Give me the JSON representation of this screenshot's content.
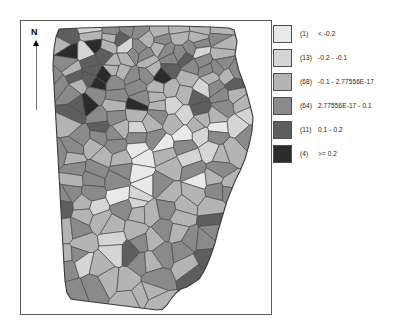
{
  "map": {
    "title": "Georgia Counties Choropleth",
    "north_arrow": {
      "label": "N",
      "icon": "north-arrow-icon"
    },
    "region": "Georgia",
    "feature_count": 161,
    "polygon_outline_color": "#4a4a4a",
    "background_color": "#ffffff",
    "frame_color": "#5a5a5a"
  },
  "legend": {
    "classes": [
      {
        "count": "(1)",
        "range": "<    -0.2",
        "color": "#e9e9e9"
      },
      {
        "count": "(13)",
        "range": "-0.2 -     -0.1",
        "color": "#d5d5d5"
      },
      {
        "count": "(68)",
        "range": "-0.1 - 2.77556E-17",
        "color": "#b4b4b4"
      },
      {
        "count": "(64)",
        "range": "2.77556E-17 -      0.1",
        "color": "#8a8a8a"
      },
      {
        "count": "(11)",
        "range": "0.1 -      0.2",
        "color": "#5e5e5e"
      },
      {
        "count": "(4)",
        "range": ">=    0.2",
        "color": "#2b2b2b"
      }
    ]
  },
  "chart_data": {
    "type": "heatmap",
    "categories": [
      "< -0.2",
      "-0.2 - -0.1",
      "-0.1 - 2.77556E-17",
      "2.77556E-17 - 0.1",
      "0.1 - 0.2",
      ">= 0.2"
    ],
    "values": [
      1,
      13,
      68,
      64,
      11,
      4
    ],
    "colors": [
      "#e9e9e9",
      "#d5d5d5",
      "#b4b4b4",
      "#8a8a8a",
      "#5e5e5e",
      "#2b2b2b"
    ],
    "xlabel": "",
    "ylabel": "Number of counties",
    "legend_position": "right"
  }
}
